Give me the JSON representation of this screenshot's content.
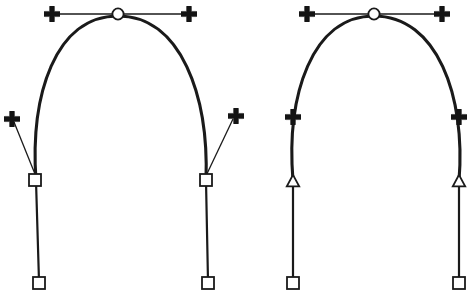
{
  "figure": {
    "background_color": "#ffffff",
    "stroke_color": "#1a1a1a",
    "marker_fill_open": "#ffffff",
    "marker_fill_solid": "#141414",
    "width": 471,
    "height": 295
  },
  "shapes": [
    {
      "id": "left-shape",
      "name": "arch-path-with-detached-handles",
      "description": "Arch shaped bezier path with smooth apex anchor and corner anchors whose direction handles are pulled away from the path",
      "apex_anchor": {
        "marker": "circle-open",
        "x": 118,
        "y": 14
      },
      "apex_handles": [
        {
          "marker": "cross-solid",
          "x": 52,
          "y": 14,
          "side": "left"
        },
        {
          "marker": "cross-solid",
          "x": 189,
          "y": 14,
          "side": "right"
        }
      ],
      "side_anchors": [
        {
          "marker": "square-open",
          "x": 35,
          "y": 180,
          "side": "left"
        },
        {
          "marker": "square-open",
          "x": 206,
          "y": 180,
          "side": "right"
        }
      ],
      "side_handles": [
        {
          "marker": "cross-solid",
          "x": 11,
          "y": 119,
          "side": "left"
        },
        {
          "marker": "cross-solid",
          "x": 236,
          "y": 116,
          "side": "right"
        }
      ],
      "end_anchors": [
        {
          "marker": "square-open",
          "x": 39,
          "y": 283,
          "side": "left"
        },
        {
          "marker": "square-open",
          "x": 208,
          "y": 283,
          "side": "right"
        }
      ]
    },
    {
      "id": "right-shape",
      "name": "arch-path-with-on-path-markers",
      "description": "Arch shaped bezier path with smooth apex anchor, cross markers sitting directly on the path and triangular direction markers on the vertical legs",
      "apex_anchor": {
        "marker": "circle-open",
        "x": 374,
        "y": 14
      },
      "apex_handles": [
        {
          "marker": "cross-solid",
          "x": 307,
          "y": 14,
          "side": "left"
        },
        {
          "marker": "cross-solid",
          "x": 442,
          "y": 14,
          "side": "right"
        }
      ],
      "side_anchors": [
        {
          "marker": "cross-solid",
          "x": 293,
          "y": 117,
          "side": "left"
        },
        {
          "marker": "cross-solid",
          "x": 459,
          "y": 117,
          "side": "right"
        }
      ],
      "direction_markers": [
        {
          "marker": "triangle-open-up",
          "x": 293,
          "y": 181,
          "side": "left"
        },
        {
          "marker": "triangle-open-up",
          "x": 459,
          "y": 181,
          "side": "right"
        }
      ],
      "end_anchors": [
        {
          "marker": "square-open",
          "x": 293,
          "y": 283,
          "side": "left"
        },
        {
          "marker": "square-open",
          "x": 459,
          "y": 283,
          "side": "right"
        }
      ]
    }
  ],
  "geometry": {
    "left_arch_path": "M 36,181 C 30,95 55,16 118,16 C 181,16 209,96 206,181",
    "left_leg_left": "M 36,181 L 39,281",
    "left_leg_right": "M 206,181 L 208,281",
    "left_handle_bar": "M 55,14 L 186,14",
    "left_handle_leg_left": "M 14,122 L 37,179",
    "left_handle_leg_right": "M 233,119 L 204,180",
    "right_arch_path": "M 293,181 C 286,95 312,16 374,16 C 437,16 466,96 459,181",
    "right_leg_left": "M 293,181 L 293,281",
    "right_leg_right": "M 459,181 L 459,281",
    "right_handle_bar": "M 310,14 L 439,14"
  },
  "markers": {
    "circle_open": {
      "label": "smooth-anchor-point",
      "radius": 6
    },
    "square_open": {
      "label": "corner-anchor-point",
      "size": 13
    },
    "cross_solid": {
      "label": "direction-handle",
      "size": 13
    },
    "triangle_open_up": {
      "label": "direction-arrow",
      "size": 12
    }
  }
}
